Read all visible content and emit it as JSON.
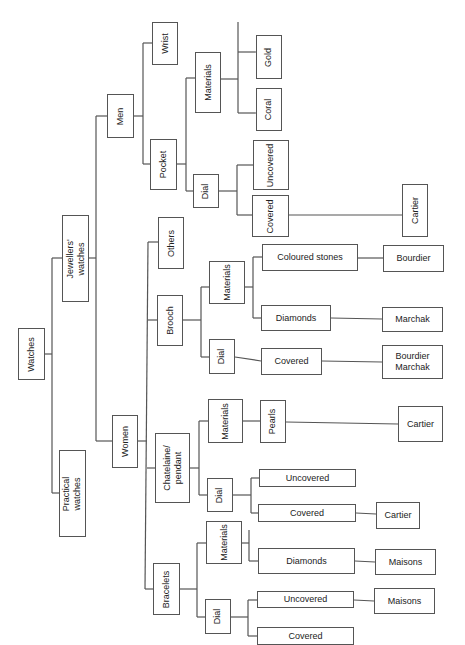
{
  "colors": {
    "line": "#555555",
    "text": "#222222",
    "background": "#ffffff"
  },
  "nodes": {
    "watches": "Watches",
    "jewellers_watches": "Jewellers' watches",
    "practical_watches": "Practical watches",
    "men": "Men",
    "women": "Women",
    "wrist": "Wrist",
    "pocket": "Pocket",
    "pocket_materials": "Materials",
    "pocket_gold": "Gold",
    "pocket_coral": "Coral",
    "pocket_dial": "Dial",
    "pocket_dial_uncovered": "Uncovered",
    "pocket_dial_covered": "Covered",
    "pocket_dial_covered_cartier": "Cartier",
    "others": "Others",
    "brooch": "Brooch",
    "brooch_materials": "Materials",
    "brooch_coloured_stones": "Coloured stones",
    "brooch_coloured_stones_maker": "Bourdier",
    "brooch_diamonds": "Diamonds",
    "brooch_diamonds_maker": "Marchak",
    "brooch_dial": "Dial",
    "brooch_dial_covered": "Covered",
    "brooch_dial_covered_makers": "Bourdier\nMarchak",
    "chatelaine": "Chatelaine/\npendant",
    "chatelaine_materials": "Materials",
    "chatelaine_pearls": "Pearls",
    "chatelaine_pearls_maker": "Cartier",
    "chatelaine_dial": "Dial",
    "chatelaine_dial_uncovered": "Uncovered",
    "chatelaine_dial_covered": "Covered",
    "chatelaine_dial_covered_maker": "Cartier",
    "bracelets": "Bracelets",
    "bracelets_materials": "Materials",
    "bracelets_diamonds": "Diamonds",
    "bracelets_diamonds_maker": "Maisons",
    "bracelets_dial": "Dial",
    "bracelets_dial_uncovered": "Uncovered",
    "bracelets_dial_uncovered_maker": "Maisons",
    "bracelets_dial_covered": "Covered"
  }
}
